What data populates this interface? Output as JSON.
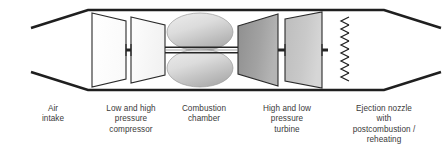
{
  "diagram": {
    "colors": {
      "outline": "#1a1a1a",
      "casing": "#262626",
      "compressor_fill_1": "#fdfdfd",
      "compressor_fill_2": "#f7f7f7",
      "chamber_fill_light": "#e8e8e8",
      "chamber_fill_dark": "#b5b5b5",
      "turbine_fill_1": "#9d9d9d",
      "turbine_fill_2": "#c8c8c8",
      "shaft": "#2b2b2b",
      "label_text": "#3a3a3a"
    },
    "components": [
      {
        "name": "air-intake",
        "shape": "converging-duct"
      },
      {
        "name": "low-pressure-compressor",
        "shape": "trapezoid"
      },
      {
        "name": "high-pressure-compressor",
        "shape": "trapezoid"
      },
      {
        "name": "combustion-chamber-upper",
        "shape": "ellipse"
      },
      {
        "name": "combustion-chamber-lower",
        "shape": "ellipse"
      },
      {
        "name": "high-pressure-turbine",
        "shape": "trapezoid"
      },
      {
        "name": "low-pressure-turbine",
        "shape": "trapezoid"
      },
      {
        "name": "shaft",
        "shape": "triple-line"
      },
      {
        "name": "afterburner-chevrons",
        "shape": "zigzag-column",
        "count": 8
      }
    ]
  },
  "labels": [
    {
      "name": "air-intake",
      "lines": [
        "Air",
        "intake"
      ]
    },
    {
      "name": "compressor",
      "lines": [
        "Low and high",
        "pressure",
        "compressor"
      ]
    },
    {
      "name": "combustion-chamber",
      "lines": [
        "Combustion",
        "chamber"
      ]
    },
    {
      "name": "turbine",
      "lines": [
        "High and low",
        "pressure",
        "turbine"
      ]
    },
    {
      "name": "ejection-nozzle",
      "lines": [
        "Ejection nozzle",
        "with",
        "postcombustion /",
        "reheating"
      ]
    }
  ]
}
